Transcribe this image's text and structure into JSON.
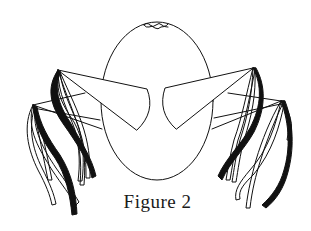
{
  "figure": {
    "caption": "Figure 2",
    "colors": {
      "background": "#ffffff",
      "stroke": "#111111",
      "ribbon_fill": "#111111"
    }
  }
}
